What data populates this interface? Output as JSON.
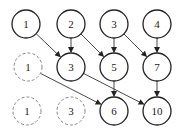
{
  "diagram": {
    "nodes": [
      {
        "id": "r1c1",
        "label": "1",
        "x": 26,
        "y": 24,
        "style": "solid"
      },
      {
        "id": "r1c2",
        "label": "2",
        "x": 71,
        "y": 24,
        "style": "solid"
      },
      {
        "id": "r1c3",
        "label": "3",
        "x": 114,
        "y": 24,
        "style": "solid"
      },
      {
        "id": "r1c4",
        "label": "4",
        "x": 157,
        "y": 24,
        "style": "solid"
      },
      {
        "id": "r2c1",
        "label": "1",
        "x": 28,
        "y": 67,
        "style": "dashed"
      },
      {
        "id": "r2c2",
        "label": "3",
        "x": 71,
        "y": 67,
        "style": "solid"
      },
      {
        "id": "r2c3",
        "label": "5",
        "x": 114,
        "y": 67,
        "style": "solid"
      },
      {
        "id": "r2c4",
        "label": "7",
        "x": 157,
        "y": 67,
        "style": "solid"
      },
      {
        "id": "r3c1",
        "label": "1",
        "x": 27,
        "y": 111,
        "style": "dashed"
      },
      {
        "id": "r3c2",
        "label": "3",
        "x": 71,
        "y": 111,
        "style": "dashed"
      },
      {
        "id": "r3c3",
        "label": "6",
        "x": 114,
        "y": 111,
        "style": "solid"
      },
      {
        "id": "r3c4",
        "label": "10",
        "x": 157,
        "y": 111,
        "style": "solid"
      }
    ],
    "edges": [
      {
        "from": "r1c1",
        "to": "r2c2"
      },
      {
        "from": "r1c2",
        "to": "r2c2"
      },
      {
        "from": "r1c2",
        "to": "r2c3"
      },
      {
        "from": "r1c3",
        "to": "r2c3"
      },
      {
        "from": "r1c3",
        "to": "r2c4"
      },
      {
        "from": "r1c4",
        "to": "r2c4"
      },
      {
        "from": "r2c1",
        "to": "r3c3"
      },
      {
        "from": "r2c3",
        "to": "r3c3"
      },
      {
        "from": "r2c2",
        "to": "r3c4"
      },
      {
        "from": "r2c4",
        "to": "r3c4"
      }
    ],
    "node_radius": 14,
    "colors": {
      "stroke": "#222222",
      "dashed_stroke": "#888888",
      "edge": "#333333"
    }
  }
}
